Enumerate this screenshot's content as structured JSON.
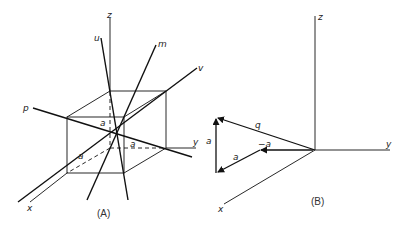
{
  "figure": {
    "panel_a": {
      "caption": "(A)",
      "axis_labels": {
        "z": "z",
        "y": "y",
        "x": "x"
      },
      "line_labels": {
        "u": "u",
        "m": "m",
        "v": "v",
        "p": "p"
      },
      "edge_labels": {
        "a_top": "a",
        "a_right": "a",
        "a_left": "a"
      }
    },
    "panel_b": {
      "caption": "(B)",
      "axis_labels": {
        "z": "z",
        "y": "y",
        "x": "x"
      },
      "vector_labels": {
        "q": "q",
        "a_vertical": "a",
        "a_diag": "a",
        "neg_a": "−a"
      }
    }
  }
}
